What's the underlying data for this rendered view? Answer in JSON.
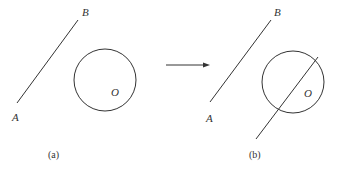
{
  "figure_a": {
    "caption": "(a)",
    "label_a": "A",
    "label_b": "B",
    "label_o": "O"
  },
  "figure_b": {
    "caption": "(b)",
    "label_a": "A",
    "label_b": "B",
    "label_o": "O"
  },
  "colors": {
    "stroke": "#333333",
    "background": "#ffffff"
  }
}
